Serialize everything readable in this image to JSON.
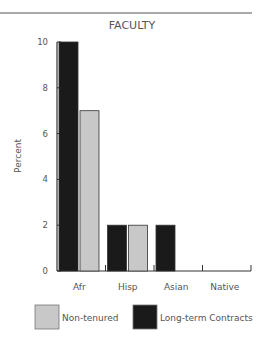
{
  "chart_data": {
    "type": "bar",
    "title": "FACULTY",
    "xlabel": "",
    "ylabel": "Percent",
    "ylim": [
      0,
      10
    ],
    "yticks": [
      0,
      2,
      4,
      6,
      8,
      10
    ],
    "categories": [
      "Afr",
      "Hisp",
      "Asian",
      "Native"
    ],
    "series": [
      {
        "name": "Long-term Contracts",
        "color": "#1a1a1a",
        "values": [
          10,
          2,
          2,
          0
        ]
      },
      {
        "name": "Non-tenured",
        "color": "#c8c8c8",
        "values": [
          7,
          2,
          0,
          0
        ]
      }
    ],
    "legend": {
      "placement": "bottom",
      "entries": [
        {
          "label": "Non-tenured",
          "color": "#c8c8c8"
        },
        {
          "label": "Long-term Contracts",
          "color": "#1a1a1a"
        }
      ]
    },
    "grid": false
  }
}
